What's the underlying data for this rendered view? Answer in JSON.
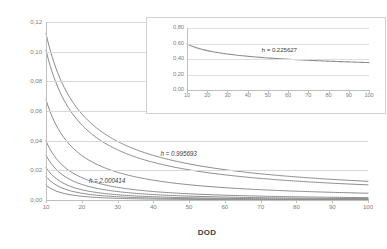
{
  "chart_data": [
    {
      "id": "main",
      "type": "line",
      "title": "",
      "xlabel": "DOD",
      "ylabel": "1/DOD^h",
      "xlim": [
        10,
        100
      ],
      "ylim": [
        0.0,
        0.12
      ],
      "xticks": [
        10,
        20,
        30,
        40,
        50,
        60,
        70,
        80,
        90,
        100
      ],
      "yticks": [
        "0,00",
        "0,02",
        "0,04",
        "0,06",
        "0,08",
        "0,10",
        "0,12"
      ],
      "ytick_values": [
        0.0,
        0.02,
        0.04,
        0.06,
        0.08,
        0.1,
        0.12
      ],
      "grid": true,
      "legend": "none",
      "annotations": [
        {
          "text": "h = 0.995693",
          "x": 42,
          "y": 0.028
        },
        {
          "text": "h = 2.000414",
          "x": 22,
          "y": 0.01
        }
      ],
      "series": [
        {
          "name": "h = 0.95",
          "h": 0.95,
          "x": [
            10,
            20,
            30,
            40,
            50,
            60,
            70,
            80,
            90,
            100
          ],
          "values": [
            0.1122,
            0.0581,
            0.0395,
            0.0301,
            0.0244,
            0.0205,
            0.0177,
            0.0156,
            0.0139,
            0.0126
          ]
        },
        {
          "name": "h = 0.995693",
          "h": 0.995693,
          "x": [
            10,
            20,
            30,
            40,
            50,
            60,
            70,
            80,
            90,
            100
          ],
          "values": [
            0.101,
            0.0506,
            0.0338,
            0.0254,
            0.0203,
            0.0169,
            0.0145,
            0.0127,
            0.0113,
            0.0101
          ]
        },
        {
          "name": "h = 1.17",
          "h": 1.17,
          "x": [
            10,
            20,
            30,
            40,
            50,
            60,
            70,
            80,
            90,
            100
          ],
          "values": [
            0.0676,
            0.0301,
            0.0185,
            0.0134,
            0.0103,
            0.0084,
            0.007,
            0.006,
            0.0052,
            0.0046
          ]
        },
        {
          "name": "h = 1.40",
          "h": 1.4,
          "x": [
            10,
            20,
            30,
            40,
            50,
            60,
            70,
            80,
            90,
            100
          ],
          "values": [
            0.0398,
            0.0151,
            0.0085,
            0.0057,
            0.0042,
            0.0032,
            0.0026,
            0.0022,
            0.0019,
            0.0016
          ]
        },
        {
          "name": "h = 1.52",
          "h": 1.52,
          "x": [
            10,
            20,
            30,
            40,
            50,
            60,
            70,
            80,
            90,
            100
          ],
          "values": [
            0.0302,
            0.0105,
            0.0057,
            0.0037,
            0.0026,
            0.002,
            0.0016,
            0.0013,
            0.0011,
            0.0009
          ]
        },
        {
          "name": "h = 1.66",
          "h": 1.66,
          "x": [
            10,
            20,
            30,
            40,
            50,
            60,
            70,
            80,
            90,
            100
          ],
          "values": [
            0.0219,
            0.0069,
            0.0036,
            0.0022,
            0.0015,
            0.0011,
            0.0009,
            0.0007,
            0.0006,
            0.0005
          ]
        },
        {
          "name": "h = 1.80",
          "h": 1.8,
          "x": [
            10,
            20,
            30,
            40,
            50,
            60,
            70,
            80,
            90,
            100
          ],
          "values": [
            0.0158,
            0.0045,
            0.0022,
            0.0013,
            0.0009,
            0.0006,
            0.0005,
            0.0004,
            0.0003,
            0.0003
          ]
        },
        {
          "name": "h = 2.000414",
          "h": 2.000414,
          "x": [
            10,
            20,
            30,
            40,
            50,
            60,
            70,
            80,
            90,
            100
          ],
          "values": [
            0.01,
            0.0025,
            0.0011,
            0.0006,
            0.0004,
            0.0003,
            0.0002,
            0.0002,
            0.0001,
            0.0001
          ]
        }
      ]
    },
    {
      "id": "inset",
      "type": "line",
      "title": "",
      "xlabel": "",
      "ylabel": "",
      "xlim": [
        10,
        100
      ],
      "ylim": [
        0.0,
        0.8
      ],
      "xticks": [
        10,
        20,
        30,
        40,
        50,
        60,
        70,
        80,
        90,
        100
      ],
      "yticks": [
        "0,00",
        "0,20",
        "0,40",
        "0,60",
        "0,80"
      ],
      "ytick_values": [
        0.0,
        0.2,
        0.4,
        0.6,
        0.8
      ],
      "grid": true,
      "legend": "none",
      "annotations": [
        {
          "text": "h = 0.225627",
          "x": 47,
          "y": 0.46
        }
      ],
      "series": [
        {
          "name": "h = 0.225627",
          "h": 0.225627,
          "x": [
            10,
            20,
            30,
            40,
            50,
            60,
            70,
            80,
            90,
            100
          ],
          "values": [
            0.5953,
            0.5093,
            0.4654,
            0.4357,
            0.4136,
            0.3981,
            0.3849,
            0.3728,
            0.3636,
            0.3554
          ]
        }
      ]
    }
  ],
  "axes": {
    "main": {
      "xlabel": "DOD",
      "ylabel": "1/DOD",
      "ylabel_exponent": "h"
    }
  }
}
